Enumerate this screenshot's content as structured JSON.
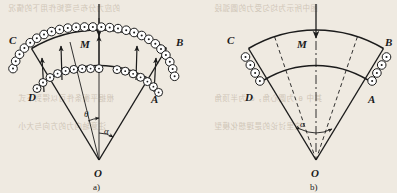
{
  "figure": {
    "background_color": "#efeae1",
    "ink_color": "#1b1b1b",
    "panels": [
      {
        "id": "a",
        "caption": "a)",
        "labels": {
          "corner_top_left": "C",
          "corner_top_right": "B",
          "corner_bottom_left": "D",
          "corner_bottom_right": "A",
          "center_load": "M",
          "vertex": "O",
          "angle_theta": "θ",
          "angle_alpha": "α"
        },
        "rollers_outer_arc": 26,
        "rollers_inner_arc": 18,
        "force_arrows_up": 5,
        "center_arrow_direction": "down",
        "radial_lines": "solid"
      },
      {
        "id": "b",
        "caption": "b)",
        "labels": {
          "corner_top_left": "C",
          "corner_top_right": "B",
          "corner_bottom_left": "D",
          "corner_bottom_right": "A",
          "center_load": "M",
          "vertex": "O",
          "angle_alpha": "α"
        },
        "rollers_left_edge": 4,
        "rollers_right_edge": 4,
        "force_arrows_up": 0,
        "center_arrow_direction": "down",
        "radial_lines": "dashed"
      }
    ],
    "bleed_through_text": [
      "的应力分布与弯矩作用下的情况",
      "图中所示为均匀受力的圆弧段",
      "根据平衡条件可以得到下式",
      "其中 θ 为圆心角，α 为半顶角",
      "注意轴向力的方向与大小",
      "这里讨论的是理想化模型"
    ]
  }
}
